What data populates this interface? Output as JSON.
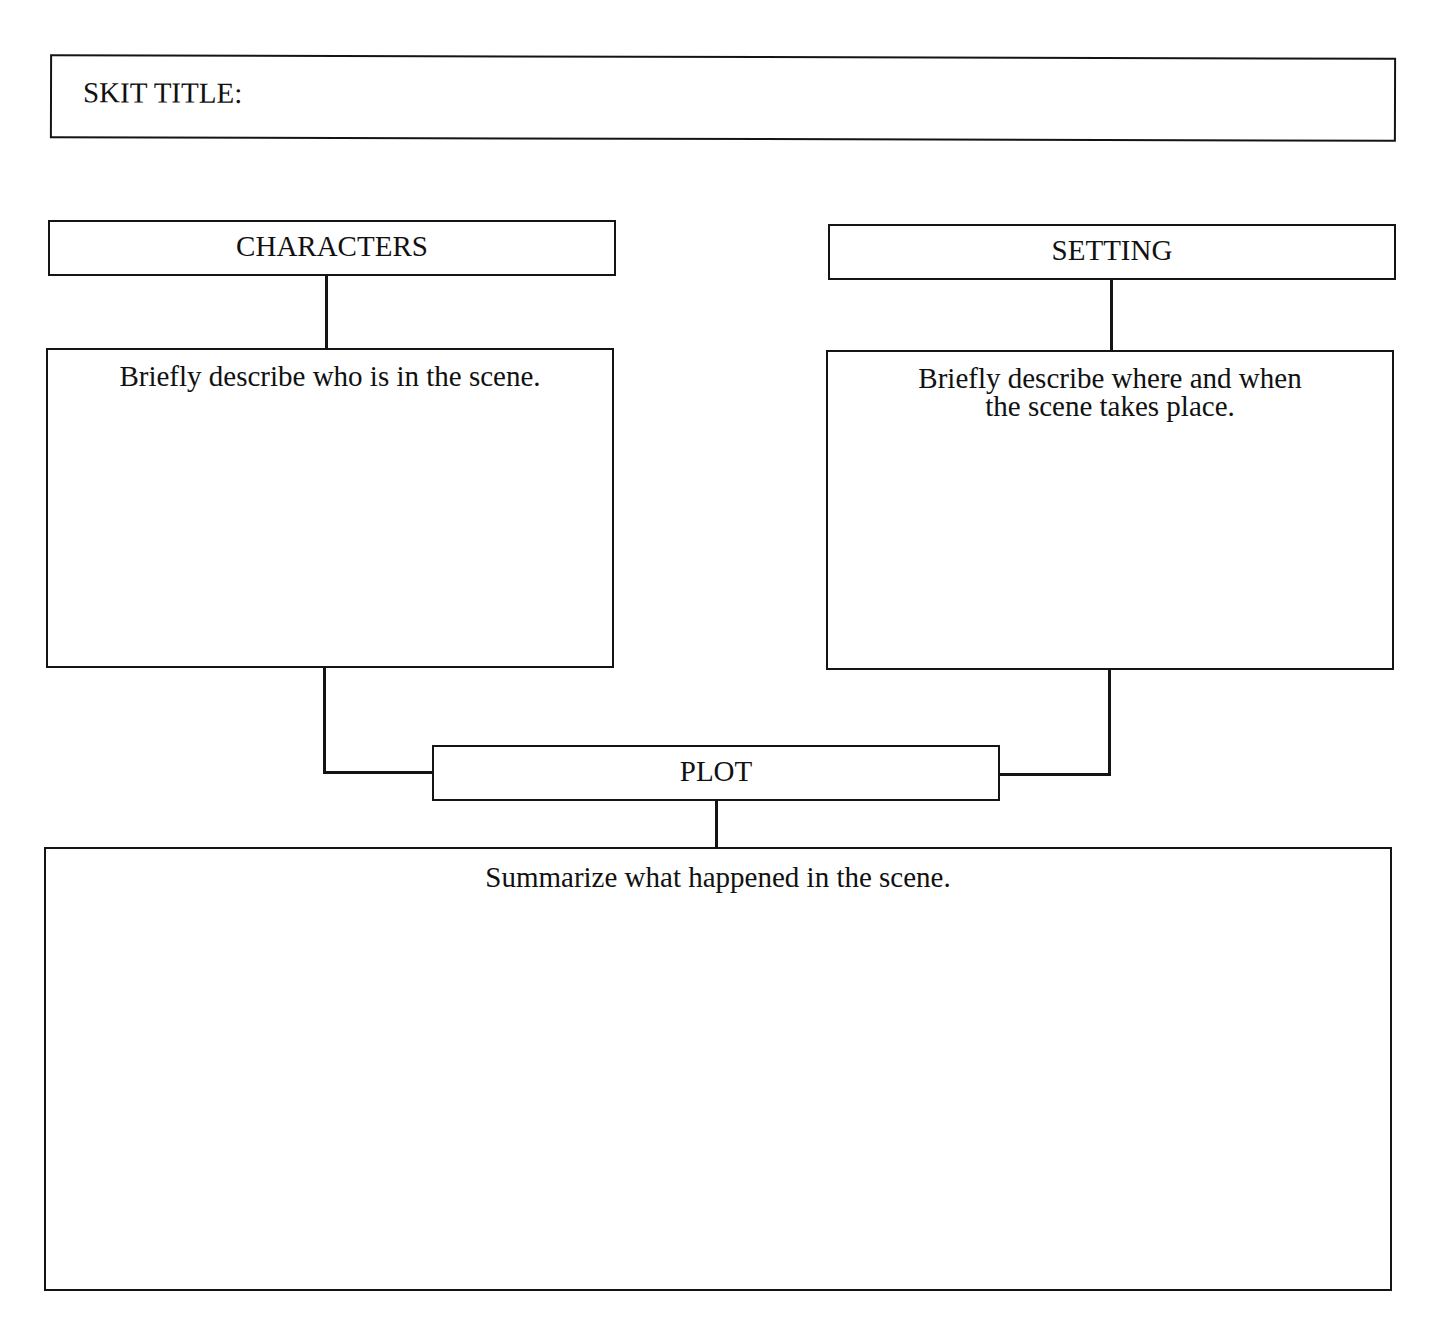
{
  "worksheet": {
    "title_box": {
      "label": "SKIT TITLE:",
      "value": ""
    },
    "characters": {
      "header": "CHARACTERS",
      "prompt": "Briefly describe who is in the scene.",
      "value": ""
    },
    "setting": {
      "header": "SETTING",
      "prompt_line1": "Briefly describe where and when",
      "prompt_line2": "the scene takes place.",
      "value": ""
    },
    "plot": {
      "header": "PLOT",
      "prompt": "Summarize what happened in the scene.",
      "value": ""
    }
  },
  "colors": {
    "ink": "#141414",
    "paper": "#ffffff"
  }
}
